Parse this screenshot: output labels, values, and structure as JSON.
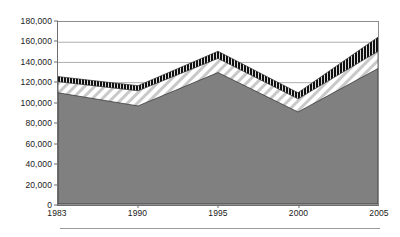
{
  "chart_data": {
    "type": "area",
    "title": "",
    "subtitle": "",
    "xlabel": "",
    "ylabel": "",
    "stacked": true,
    "grid": true,
    "grid_axis": "y",
    "legend": "none",
    "x": [
      1983,
      1990,
      1995,
      2000,
      2005
    ],
    "categories": [
      "1983",
      "1990",
      "1995",
      "2000",
      "2005"
    ],
    "xlim": [
      1983,
      2005
    ],
    "ylim": [
      0,
      180000
    ],
    "ytick_interval": 20000,
    "ytick_values": [
      0,
      20000,
      40000,
      60000,
      80000,
      100000,
      120000,
      140000,
      160000,
      180000
    ],
    "ytick_labels": [
      "0",
      "20,000",
      "40,000",
      "60,000",
      "80,000",
      "100,000",
      "120,000",
      "140,000",
      "160,000",
      "180,000"
    ],
    "xtick_labels": [
      "1983",
      "1990",
      "1995",
      "2000",
      "2005"
    ],
    "series": [
      {
        "name": "series-1",
        "pattern": "solid-gray",
        "color": "#808080",
        "values": [
          110000,
          97000,
          130000,
          91000,
          134000
        ],
        "cumulative": [
          110000,
          97000,
          130000,
          91000,
          134000
        ]
      },
      {
        "name": "series-2",
        "pattern": "diagonal-hatch",
        "color": "#ffffff",
        "values": [
          11000,
          15000,
          14000,
          13000,
          17000
        ],
        "cumulative": [
          121000,
          112000,
          144000,
          104000,
          151000
        ]
      },
      {
        "name": "series-3",
        "pattern": "black-vertical-stripe",
        "color": "#111111",
        "values": [
          5000,
          5000,
          7000,
          6000,
          14000
        ],
        "cumulative": [
          126000,
          117000,
          151000,
          110000,
          165000
        ]
      }
    ]
  },
  "figure": {
    "background": "#ffffff",
    "axis_color": "#6e6e6e",
    "grid_color": "#9b9b9b",
    "plot_border_color": "#8d8d8d",
    "footer_rule_color": "#9a9a9a"
  }
}
